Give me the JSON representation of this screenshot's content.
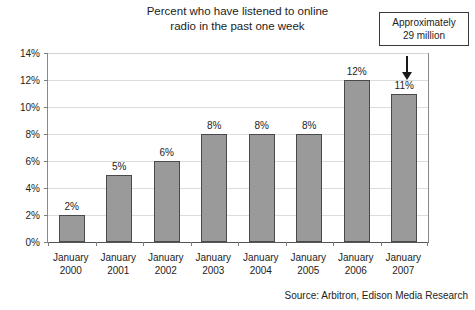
{
  "chart_data": {
    "type": "bar",
    "title": "Percent who have listened to online radio in the past one week",
    "title_lines": [
      "Percent who have listened to online",
      "radio in the past one week"
    ],
    "categories": [
      "January 2000",
      "January 2001",
      "January 2002",
      "January 2003",
      "January 2004",
      "January 2005",
      "January 2006",
      "January 2007"
    ],
    "category_lines": [
      {
        "month": "January",
        "year": "2000"
      },
      {
        "month": "January",
        "year": "2001"
      },
      {
        "month": "January",
        "year": "2002"
      },
      {
        "month": "January",
        "year": "2003"
      },
      {
        "month": "January",
        "year": "2004"
      },
      {
        "month": "January",
        "year": "2005"
      },
      {
        "month": "January",
        "year": "2006"
      },
      {
        "month": "January",
        "year": "2007"
      }
    ],
    "values": [
      2,
      5,
      6,
      8,
      8,
      8,
      12,
      11
    ],
    "value_labels": [
      "2%",
      "5%",
      "6%",
      "8%",
      "8%",
      "8%",
      "12%",
      "11%"
    ],
    "xlabel": "",
    "ylabel": "",
    "ylim": [
      0,
      14
    ],
    "ytick_values": [
      0,
      2,
      4,
      6,
      8,
      10,
      12,
      14
    ],
    "ytick_labels": [
      "0%",
      "2%",
      "4%",
      "6%",
      "8%",
      "10%",
      "12%",
      "14%"
    ],
    "grid": true,
    "legend": false,
    "bar_color": "#9a9a9a",
    "bar_edge_color": "#4a4a4a",
    "annotations": [
      {
        "lines": [
          "Approximately",
          "29 million"
        ],
        "target_category": "January 2007"
      }
    ],
    "source": "Source: Arbitron, Edison Media Research"
  }
}
